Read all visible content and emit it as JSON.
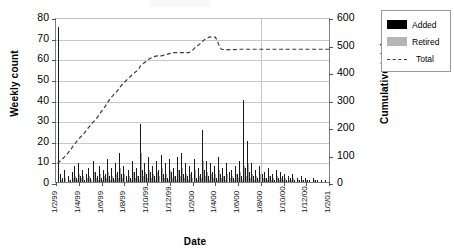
{
  "chart_data": {
    "type": "bar",
    "title": "",
    "xlabel": "Date",
    "ylabel": "Weekly count",
    "ylabel_secondary": "Cumulative total",
    "ylim": [
      0,
      80
    ],
    "ylim_secondary": [
      0,
      600
    ],
    "ytick_labels": [
      "80",
      "70",
      "60",
      "50",
      "40",
      "30",
      "20",
      "10",
      "0"
    ],
    "ytick_values": [
      80,
      70,
      60,
      50,
      40,
      30,
      20,
      10,
      0
    ],
    "ytick_labels_secondary": [
      "600",
      "500",
      "400",
      "300",
      "200",
      "100",
      "0"
    ],
    "ytick_values_secondary": [
      600,
      500,
      400,
      300,
      200,
      100,
      0
    ],
    "xtick_labels": [
      "1/2/99",
      "1/4/99",
      "1/6/99",
      "1/8/99",
      "1/10/99",
      "1/12/99",
      "1/2/00",
      "1/4/00",
      "1/6/00",
      "1/8/00",
      "1/10/00",
      "1/12/00",
      "1/2/01"
    ],
    "grid": "horizontal",
    "legend_position": "right-outside",
    "legend": [
      {
        "label": "Added",
        "color": "#000000",
        "kind": "bar"
      },
      {
        "label": "Retired",
        "color": "#b5b5b5",
        "kind": "bar"
      },
      {
        "label": "Total",
        "color": "#3a3a3a",
        "kind": "dashed-line"
      }
    ],
    "series": [
      {
        "name": "Added",
        "color": "#1a1a1a",
        "axis": "left",
        "values": [
          75,
          4,
          2,
          6,
          0,
          3,
          1,
          5,
          8,
          2,
          9,
          3,
          6,
          1,
          4,
          7,
          2,
          10,
          5,
          3,
          8,
          2,
          6,
          4,
          11,
          3,
          7,
          2,
          9,
          5,
          14,
          4,
          8,
          3,
          6,
          2,
          10,
          5,
          7,
          3,
          28,
          6,
          9,
          4,
          12,
          5,
          8,
          3,
          10,
          6,
          13,
          4,
          9,
          2,
          11,
          5,
          7,
          3,
          12,
          6,
          14,
          4,
          9,
          3,
          8,
          5,
          11,
          2,
          7,
          4,
          25,
          6,
          10,
          3,
          9,
          5,
          8,
          2,
          12,
          4,
          7,
          3,
          9,
          5,
          6,
          2,
          8,
          4,
          10,
          3,
          40,
          7,
          20,
          5,
          9,
          3,
          6,
          2,
          8,
          4,
          5,
          2,
          7,
          3,
          4,
          1,
          6,
          2,
          5,
          3,
          4,
          1,
          3,
          2,
          4,
          1,
          2,
          1,
          3,
          1,
          2,
          1,
          1,
          0,
          2,
          1,
          1,
          0,
          1,
          0,
          1,
          0
        ]
      },
      {
        "name": "Retired",
        "color": "#a6a6a6",
        "axis": "left",
        "values": [
          0,
          1,
          0,
          2,
          0,
          1,
          0,
          2,
          3,
          1,
          4,
          2,
          3,
          0,
          2,
          3,
          1,
          5,
          2,
          1,
          4,
          1,
          3,
          2,
          5,
          1,
          3,
          1,
          4,
          2,
          7,
          2,
          4,
          1,
          3,
          1,
          5,
          2,
          3,
          1,
          14,
          3,
          5,
          2,
          6,
          2,
          4,
          1,
          5,
          3,
          7,
          2,
          4,
          1,
          6,
          2,
          3,
          1,
          6,
          3,
          7,
          2,
          4,
          1,
          4,
          2,
          6,
          1,
          3,
          2,
          10,
          3,
          5,
          1,
          4,
          2,
          4,
          1,
          6,
          2,
          3,
          1,
          4,
          2,
          3,
          1,
          4,
          2,
          5,
          1,
          8,
          3,
          9,
          2,
          4,
          1,
          3,
          1,
          4,
          2,
          2,
          1,
          3,
          1,
          2,
          0,
          3,
          1,
          2,
          1,
          2,
          0,
          1,
          1,
          2,
          0,
          1,
          0,
          1,
          0,
          1,
          0,
          0,
          0,
          1,
          0,
          0,
          0,
          0,
          0,
          0,
          0
        ]
      },
      {
        "name": "Total",
        "color": "#3a3a3a",
        "axis": "right",
        "style": "dashed",
        "values": [
          75,
          80,
          84,
          90,
          92,
          96,
          100,
          105,
          112,
          116,
          126,
          131,
          139,
          142,
          148,
          155,
          160,
          172,
          180,
          186,
          198,
          203,
          211,
          217,
          231,
          237,
          246,
          250,
          261,
          268,
          289,
          295,
          305,
          310,
          318,
          323,
          335,
          342,
          350,
          355,
          392,
          400,
          412,
          418,
          430,
          437,
          446,
          450,
          458,
          463,
          473,
          478,
          487,
          490,
          498,
          503,
          510,
          514,
          523,
          529,
          538,
          543,
          551,
          556,
          563,
          570,
          579,
          582,
          589,
          594,
          615,
          622,
          633,
          637,
          645,
          651,
          657,
          660,
          670,
          674,
          681,
          685,
          692,
          697,
          702,
          705,
          711,
          716,
          723,
          727,
          760,
          768,
          782,
          787,
          794,
          798,
          803,
          806,
          812,
          816,
          821,
          824,
          829,
          832,
          835,
          837,
          841,
          843,
          846,
          849,
          852,
          854,
          856,
          858,
          861,
          862,
          864,
          865,
          867,
          868,
          870,
          871,
          872,
          872,
          874,
          875,
          876,
          876,
          877,
          877,
          878,
          878
        ],
        "plotted_note": "Total drawn on right axis, rises from ~75 to peak ~535 then drops to ~490 and stays flat near 490"
      }
    ],
    "total_line_points": [
      75,
      82,
      88,
      96,
      104,
      112,
      122,
      132,
      144,
      152,
      162,
      170,
      178,
      186,
      196,
      206,
      214,
      224,
      232,
      240,
      252,
      262,
      272,
      282,
      296,
      306,
      316,
      324,
      332,
      340,
      352,
      360,
      368,
      376,
      384,
      390,
      398,
      404,
      410,
      416,
      430,
      436,
      442,
      448,
      454,
      458,
      462,
      464,
      466,
      466,
      466,
      468,
      470,
      472,
      474,
      476,
      478,
      478,
      478,
      478,
      478,
      478,
      478,
      478,
      480,
      486,
      494,
      500,
      506,
      512,
      520,
      526,
      530,
      534,
      535,
      535,
      534,
      520,
      500,
      490,
      489,
      489,
      489,
      489,
      489,
      489,
      489,
      490,
      490,
      490,
      490,
      490,
      490,
      490,
      490,
      490,
      490,
      490,
      490,
      490,
      490,
      490,
      490,
      490,
      490,
      490,
      490,
      490,
      490,
      490,
      490,
      490,
      490,
      490,
      490,
      490,
      490,
      490,
      490,
      490,
      490,
      490,
      490,
      490,
      490,
      490,
      490,
      490,
      490,
      490,
      490,
      490
    ]
  }
}
